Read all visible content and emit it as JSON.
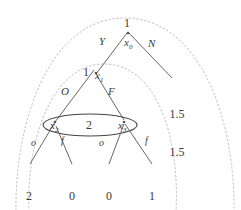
{
  "diagram": {
    "colors": {
      "stroke": "#555555",
      "dashed": "#b9b9b9",
      "ellipse": "#444444",
      "text": "#3a3a3a"
    },
    "nodes": [
      {
        "id": "x0",
        "label": "x",
        "sub": "0",
        "value": "1",
        "x": 128,
        "y": 44
      },
      {
        "id": "x1",
        "label": "x",
        "sub": "1",
        "value": "1",
        "x": 96,
        "y": 78
      },
      {
        "id": "x2",
        "label": "x",
        "sub": "2",
        "value": "",
        "x": 56,
        "y": 126
      },
      {
        "id": "x3",
        "label": "x",
        "sub": "3",
        "value": "",
        "x": 124,
        "y": 126
      }
    ],
    "node_values": {
      "root": "1",
      "x1": "1",
      "information_set": "2"
    },
    "branches": [
      {
        "id": "b-yes",
        "label": "Y",
        "from": "x0",
        "x": 100,
        "y": 42
      },
      {
        "id": "b-no",
        "label": "N",
        "from": "x0",
        "x": 151,
        "y": 44
      },
      {
        "id": "b-open",
        "label": "O",
        "from": "x1",
        "x": 64,
        "y": 90
      },
      {
        "id": "b-fight",
        "label": "F",
        "from": "x1",
        "x": 111,
        "y": 90
      },
      {
        "id": "b-o-left",
        "label": "o",
        "from": "x2",
        "x": 33,
        "y": 142
      },
      {
        "id": "b-f-left",
        "label": "f",
        "from": "x2",
        "x": 62,
        "y": 141
      },
      {
        "id": "b-o-right",
        "label": "o",
        "from": "x3",
        "x": 101,
        "y": 142
      },
      {
        "id": "b-f-right",
        "label": "f",
        "from": "x3",
        "x": 146,
        "y": 141
      }
    ],
    "payoffs": [
      {
        "id": "payoff-left-1",
        "top": "2",
        "bottom": "1",
        "x": 28,
        "y": 171
      },
      {
        "id": "payoff-left-2",
        "top": "0",
        "bottom": "0",
        "x": 71,
        "y": 171
      },
      {
        "id": "payoff-right-1",
        "top": "0",
        "bottom": "0",
        "x": 108,
        "y": 171
      },
      {
        "id": "payoff-right-2",
        "top": "1",
        "bottom": "2",
        "x": 151,
        "y": 171
      },
      {
        "id": "payoff-no",
        "top": "1.5",
        "bottom": "1.5",
        "x": 175,
        "y": 88
      }
    ],
    "information_set": {
      "id": "info-set-x2-x3",
      "value": "2",
      "value_x": 90,
      "value_y": 125
    }
  }
}
